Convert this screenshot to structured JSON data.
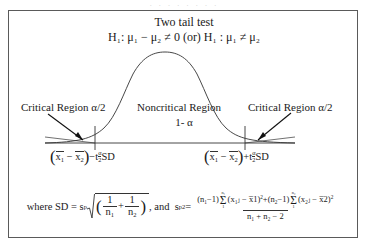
{
  "figure": {
    "clipped_top_text": "· · · · · · · ·",
    "title": "Two tail test",
    "hypothesis": {
      "prefix": "H",
      "prefix_sub": "1",
      "text": ": μ₁ − μ₂ ≠ 0 (or) H₁ : μ₁ ≠ μ₂",
      "full": "H₁: μ₁ − μ₂ ≠ 0 (or) H₁ : μ₁ ≠ μ₂"
    },
    "labels": {
      "critical_left": "Critical Region α/2",
      "noncritical": "Noncritical Region",
      "noncritical_value": "1- α",
      "critical_right": "Critical Region α/2"
    },
    "axis_labels": {
      "left": {
        "mean_diff": "(x̅1 − x̅2)",
        "operator": "−",
        "t_symbol": "t",
        "t_sub_num": "α",
        "t_sub_den": "2",
        "sd": "SD",
        "full": "(x̅1 − x̅2) − tα/2 SD"
      },
      "right": {
        "mean_diff": "(x̅1 − x̅2)",
        "operator": "+",
        "t_symbol": "t",
        "t_sub_num": "α",
        "t_sub_den": "2",
        "sd": "SD",
        "full": "(x̅1 − x̅2) + tα/2 SD"
      }
    },
    "formula": {
      "lead": "where SD =",
      "s_symbol": "s",
      "s_sub": "p",
      "one": "1",
      "n1": "n",
      "n1_sub": "1",
      "plus": "+",
      "n2": "n",
      "n2_sub": "2",
      "and": ", and",
      "sp_symbol": "s",
      "sp_sub": "p",
      "sp_sup": "2",
      "equals": "=",
      "num_left_paren": "(n",
      "num_left_sub": "1",
      "num_left_minus1": "−1)",
      "sigma": "Σ",
      "sigma_upper_1": "n₁",
      "sigma_lower_1": "1",
      "term1": "(x₁ⱼ − x̅1)",
      "term1_sup": "2",
      "num_plus": "+",
      "num_right_paren": "(n",
      "num_right_sub": "2",
      "num_right_minus1": "−1)",
      "sigma_upper_2": "n₂",
      "sigma_lower_2": "1",
      "term2": "(x₂ⱼ − x̅2)",
      "term2_sup": "2",
      "denominator": "n₁ + n₂ − 2",
      "full_sd": "where SD = sp√((1/n₁) + (1/n₂))",
      "full_sp2": "sp² = [(n₁−1)Σ(x₁ⱼ−x̅1)² + (n₂−1)Σ(x₂ⱼ−x̅2)²] / (n₁+n₂−2)"
    },
    "colors": {
      "frame_border": "#5a5a5a",
      "curve": "#333333",
      "axis": "#333333",
      "text": "#1a1a1a",
      "background": "#ffffff"
    }
  }
}
